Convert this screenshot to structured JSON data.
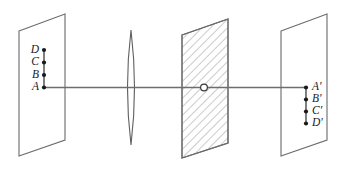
{
  "figure": {
    "background_color": "#ffffff",
    "line_color": "#6b6b6b",
    "axis_color": "#6e6e6e",
    "label_color": "#1a1a1a",
    "hatch_color": "#8c8c8c"
  },
  "object_plane": {
    "name": "object-plane",
    "points": [
      {
        "label": "D",
        "x": 44,
        "y": 50
      },
      {
        "label": "C",
        "x": 44,
        "y": 62.5
      },
      {
        "label": "B",
        "x": 44,
        "y": 75
      },
      {
        "label": "A",
        "x": 44,
        "y": 87.5
      }
    ]
  },
  "image_plane": {
    "name": "image-plane",
    "points": [
      {
        "label": "A′",
        "x": 306,
        "y": 87.5
      },
      {
        "label": "B′",
        "x": 306,
        "y": 99.5
      },
      {
        "label": "C′",
        "x": 306,
        "y": 111.5
      },
      {
        "label": "D′",
        "x": 306,
        "y": 123.5
      }
    ]
  },
  "lens": {
    "name": "converging-lens",
    "center_x": 131,
    "top_y": 30,
    "bottom_y": 145,
    "half_width": 7
  },
  "barrier": {
    "name": "hatched-screen",
    "aperture": {
      "x": 204,
      "y": 87.5,
      "radius": 3.4
    }
  },
  "optical_axis": {
    "y": 87.5,
    "start_x": 44,
    "end_x": 306
  }
}
